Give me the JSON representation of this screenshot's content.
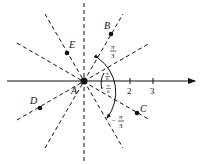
{
  "diagram": {
    "type": "polar-coordinate-figure",
    "origin": {
      "label": "A",
      "x": 84,
      "y": 81
    },
    "unit_px": 23,
    "axis": {
      "ticks": [
        {
          "value": "2",
          "x": 130
        },
        {
          "value": "3",
          "x": 153
        }
      ]
    },
    "points": [
      {
        "label": "B",
        "x": 111,
        "y": 34
      },
      {
        "label": "C",
        "x": 137,
        "y": 113
      },
      {
        "label": "D",
        "x": 40,
        "y": 108
      },
      {
        "label": "E",
        "x": 67,
        "y": 53
      }
    ],
    "angle_labels": {
      "pi_over_3": {
        "num": "π",
        "den": "3"
      },
      "pi_over_6": {
        "num": "π",
        "den": "6"
      },
      "neg_pi_over_6": {
        "sign": "−",
        "num": "π",
        "den": "6"
      },
      "neg_pi_over_3": {
        "sign": "−",
        "num": "π",
        "den": "3"
      }
    },
    "dashed_line_angles_deg": [
      90,
      30,
      -30,
      60,
      -60
    ],
    "stroke_color": "#111111"
  }
}
